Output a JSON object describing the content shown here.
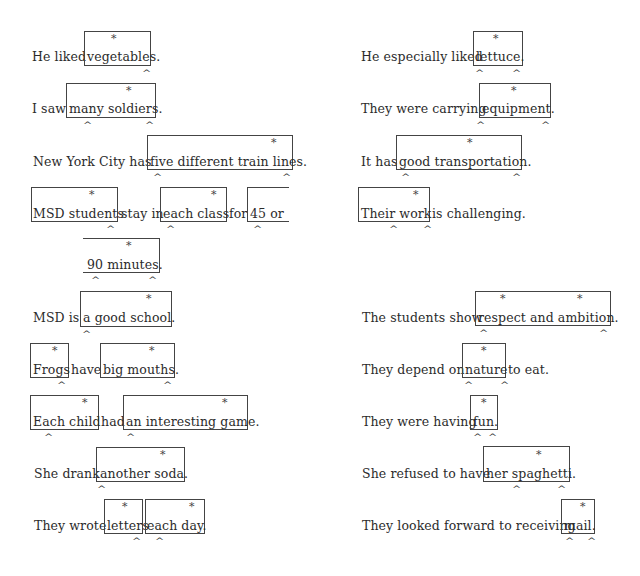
{
  "left_column": [
    {
      "pre": "He liked",
      "box": "vegetables.",
      "post": ""
    },
    {
      "pre": "I saw",
      "box": "many soldiers.",
      "post": ""
    },
    {
      "pre": "New York City has",
      "box": "five different train lines.",
      "post": ""
    },
    {
      "box1": "MSD students",
      "mid1": "stay in",
      "box2": "each class",
      "mid2": "for",
      "box3": "45 or",
      "box3_cont": "90 minutes."
    },
    {
      "pre": "MSD is",
      "box": "a good school.",
      "post": ""
    },
    {
      "box1": "Frogs",
      "mid": "have",
      "box2": "big mouths."
    },
    {
      "box1": "Each child",
      "mid": "had",
      "box2": "an interesting game."
    },
    {
      "pre": "She drank",
      "box": "another soda.",
      "post": ""
    },
    {
      "pre": "They wrote",
      "box1": "letters",
      "box2": "each day."
    }
  ],
  "right_column": [
    {
      "pre": "He especially liked",
      "box": "lettuce.",
      "post": ""
    },
    {
      "pre": "They were carrying",
      "box": "equipment.",
      "post": ""
    },
    {
      "pre": "It has",
      "box": "good transportation.",
      "post": ""
    },
    {
      "box": "Their work",
      "post": "is challenging."
    },
    {
      "pre": "The students show",
      "box": "respect and ambition.",
      "post": ""
    },
    {
      "pre": "They depend on",
      "box": "nature",
      "post": "to eat."
    },
    {
      "pre": "They were having",
      "box": "fun.",
      "post": ""
    },
    {
      "pre": "She refused to have",
      "box": "her spaghetti.",
      "post": ""
    },
    {
      "pre": "They looked forward to receiving",
      "box": "mail.",
      "post": ""
    }
  ],
  "marks": {
    "star": "*",
    "caret": "^"
  }
}
